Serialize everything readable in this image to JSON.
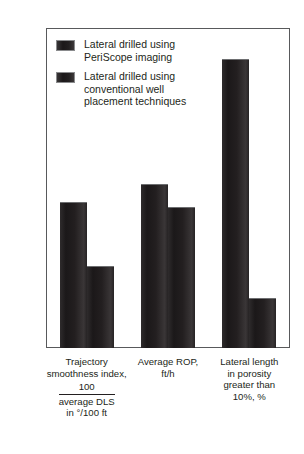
{
  "chart_data": {
    "type": "bar",
    "title": "",
    "xlabel": "",
    "ylabel": "",
    "ylim": [
      0,
      110
    ],
    "ytick_step": 10,
    "yticks": [
      0,
      10,
      20,
      30,
      40,
      50,
      60,
      70,
      80,
      90,
      100,
      110
    ],
    "grid": false,
    "legend_position": "upper-left-inside",
    "categories": [
      "Trajectory\nsmoothness index,",
      "Average ROP,\nft/h",
      "Lateral length\nin porosity\ngreater than\n10%, %"
    ],
    "category_extras": [
      {
        "fraction_numerator": "100",
        "fraction_denominator": "average DLS\nin °/100 ft"
      },
      null,
      null
    ],
    "series": [
      {
        "name": "Lateral drilled using\nPeriScope imaging",
        "values": [
          50,
          56,
          99
        ],
        "color": "#231f20"
      },
      {
        "name": "Lateral drilled using\nconventional well\nplacement techniques",
        "values": [
          28,
          48,
          17
        ],
        "color": "#231f20"
      }
    ]
  },
  "legend": {
    "items": [
      {
        "label": "Lateral drilled using\nPeriScope imaging",
        "swatch_color": "#231f20"
      },
      {
        "label": "Lateral drilled using\nconventional well\nplacement techniques",
        "swatch_color": "#231f20"
      }
    ]
  },
  "axis": {
    "frame_color": "#58595b",
    "tick_color": "#7b7c7f",
    "text_color": "#231f20"
  }
}
